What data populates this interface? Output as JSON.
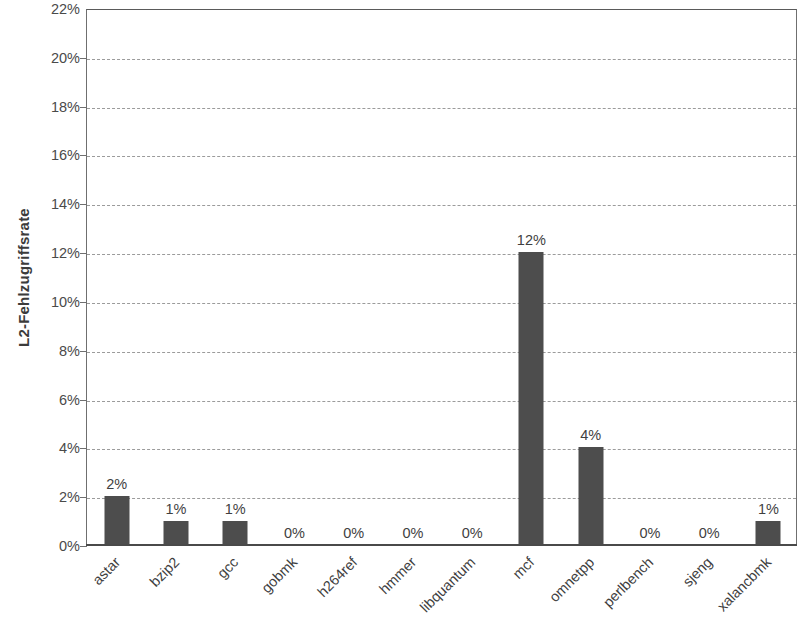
{
  "chart_data": {
    "type": "bar",
    "title": "",
    "subtitle": "",
    "xlabel": "",
    "ylabel": "L2-Fehlzugriffsrate",
    "categories": [
      "astar",
      "bzip2",
      "gcc",
      "gobmk",
      "h264ref",
      "hmmer",
      "libquantum",
      "mcf",
      "omnetpp",
      "perlbench",
      "sjeng",
      "xalancbmk"
    ],
    "values": [
      2,
      1,
      1,
      0,
      0,
      0,
      0,
      12,
      4,
      0,
      0,
      1
    ],
    "data_labels": [
      "2%",
      "1%",
      "1%",
      "0%",
      "0%",
      "0%",
      "0%",
      "12%",
      "4%",
      "0%",
      "0%",
      "1%"
    ],
    "ylim": [
      0,
      22
    ],
    "ytick_values": [
      0,
      2,
      4,
      6,
      8,
      10,
      12,
      14,
      16,
      18,
      20,
      22
    ],
    "ytick_labels": [
      "0%",
      "2%",
      "4%",
      "6%",
      "8%",
      "10%",
      "12%",
      "14%",
      "16%",
      "18%",
      "20%",
      "22%"
    ],
    "grid": true,
    "grid_axis": "y",
    "grid_style": "dashed",
    "legend": false,
    "legend_position": "none",
    "units": "percent",
    "bar_color": "#4d4d4d",
    "gridline_color": "#9b9b9b",
    "axis_color": "#4a4a4a",
    "text_color": "#3f3f3f"
  }
}
